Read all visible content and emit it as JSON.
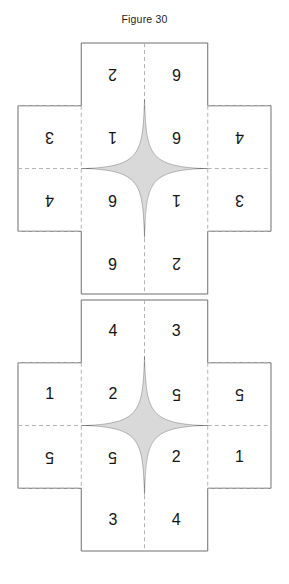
{
  "figure": {
    "caption": "Figure 30",
    "background_color": "#ffffff",
    "line_color": "#6f6f6f",
    "fold_line_color": "#b4b4b4",
    "digit_color": "#151515"
  },
  "nets": [
    {
      "id": "cross-net-1",
      "name": "upper-cross-net",
      "shape": "cross",
      "columns": 4,
      "rows": 4,
      "all_digits_rotated_180": true,
      "cells": [
        {
          "row": 1,
          "col": 1,
          "value": "",
          "present": false,
          "rotated": false
        },
        {
          "row": 1,
          "col": 2,
          "value": "2",
          "present": true,
          "rotated": true
        },
        {
          "row": 1,
          "col": 3,
          "value": "6",
          "present": true,
          "rotated": true
        },
        {
          "row": 1,
          "col": 4,
          "value": "",
          "present": false,
          "rotated": false
        },
        {
          "row": 2,
          "col": 1,
          "value": "3",
          "present": true,
          "rotated": true
        },
        {
          "row": 2,
          "col": 2,
          "value": "1",
          "present": true,
          "rotated": true
        },
        {
          "row": 2,
          "col": 3,
          "value": "6",
          "present": true,
          "rotated": true
        },
        {
          "row": 2,
          "col": 4,
          "value": "4",
          "present": true,
          "rotated": true
        },
        {
          "row": 3,
          "col": 1,
          "value": "4",
          "present": true,
          "rotated": true
        },
        {
          "row": 3,
          "col": 2,
          "value": "6",
          "present": true,
          "rotated": true
        },
        {
          "row": 3,
          "col": 3,
          "value": "1",
          "present": true,
          "rotated": true
        },
        {
          "row": 3,
          "col": 4,
          "value": "3",
          "present": true,
          "rotated": true
        },
        {
          "row": 4,
          "col": 1,
          "value": "",
          "present": false,
          "rotated": false
        },
        {
          "row": 4,
          "col": 2,
          "value": "6",
          "present": true,
          "rotated": true
        },
        {
          "row": 4,
          "col": 3,
          "value": "2",
          "present": true,
          "rotated": true
        },
        {
          "row": 4,
          "col": 4,
          "value": "",
          "present": false,
          "rotated": false
        }
      ]
    },
    {
      "id": "cross-net-2",
      "name": "lower-cross-net",
      "shape": "cross",
      "columns": 4,
      "rows": 4,
      "all_digits_rotated_180": false,
      "cells": [
        {
          "row": 1,
          "col": 1,
          "value": "",
          "present": false,
          "rotated": false
        },
        {
          "row": 1,
          "col": 2,
          "value": "4",
          "present": true,
          "rotated": false
        },
        {
          "row": 1,
          "col": 3,
          "value": "3",
          "present": true,
          "rotated": false
        },
        {
          "row": 1,
          "col": 4,
          "value": "",
          "present": false,
          "rotated": false
        },
        {
          "row": 2,
          "col": 1,
          "value": "1",
          "present": true,
          "rotated": false
        },
        {
          "row": 2,
          "col": 2,
          "value": "2",
          "present": true,
          "rotated": false
        },
        {
          "row": 2,
          "col": 3,
          "value": "5",
          "present": true,
          "rotated": true
        },
        {
          "row": 2,
          "col": 4,
          "value": "5",
          "present": true,
          "rotated": true
        },
        {
          "row": 3,
          "col": 1,
          "value": "5",
          "present": true,
          "rotated": true
        },
        {
          "row": 3,
          "col": 2,
          "value": "5",
          "present": true,
          "rotated": true
        },
        {
          "row": 3,
          "col": 3,
          "value": "2",
          "present": true,
          "rotated": false
        },
        {
          "row": 3,
          "col": 4,
          "value": "1",
          "present": true,
          "rotated": false
        },
        {
          "row": 4,
          "col": 1,
          "value": "",
          "present": false,
          "rotated": false
        },
        {
          "row": 4,
          "col": 2,
          "value": "3",
          "present": true,
          "rotated": false
        },
        {
          "row": 4,
          "col": 3,
          "value": "4",
          "present": true,
          "rotated": false
        },
        {
          "row": 4,
          "col": 4,
          "value": "",
          "present": false,
          "rotated": false
        }
      ]
    }
  ]
}
